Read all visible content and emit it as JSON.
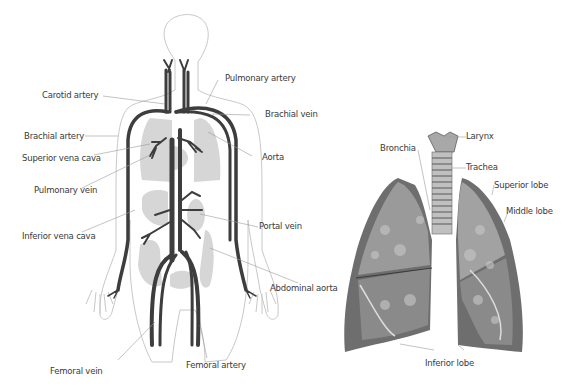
{
  "circulatory": {
    "labels": {
      "carotid_artery": "Carotid artery",
      "pulmonary_artery": "Pulmonary artery",
      "brachial_vein": "Brachial vein",
      "brachial_artery": "Brachial artery",
      "superior_vena_cava": "Superior vena cava",
      "aorta": "Aorta",
      "pulmonary_vein": "Pulmonary vein",
      "portal_vein": "Portal vein",
      "inferior_vena_cava": "Inferior vena cava",
      "abdominal_aorta": "Abdominal aorta",
      "femoral_vein": "Femoral vein",
      "femoral_artery": "Femoral artery"
    }
  },
  "respiratory": {
    "labels": {
      "larynx": "Larynx",
      "bronchia": "Bronchia",
      "trachea": "Trachea",
      "superior_lobe": "Superior lobe",
      "middle_lobe": "Middle lobe",
      "inferior_lobe": "Inferior lobe"
    }
  },
  "colors": {
    "vessel": "#3d3d3d",
    "organ": "#d6d6d6",
    "outline": "#c8c8c8",
    "leader": "#9a9a9a",
    "lung_dark": "#5a5a5a",
    "lung_mid": "#8a8a8a",
    "lung_light": "#b8b8b8"
  }
}
